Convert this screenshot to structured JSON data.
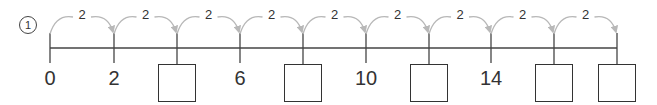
{
  "problem": {
    "number": "1"
  },
  "number_line": {
    "start": 0,
    "step": 2,
    "jump_label": "2",
    "line_color": "#444444",
    "arc_color": "#b8b8b8",
    "ticks": [
      {
        "x": 50,
        "value": "0",
        "blank": false
      },
      {
        "x": 114,
        "value": "2",
        "blank": false
      },
      {
        "x": 177,
        "value": "",
        "blank": true,
        "answer": "4"
      },
      {
        "x": 240,
        "value": "6",
        "blank": false
      },
      {
        "x": 303,
        "value": "",
        "blank": true,
        "answer": "8"
      },
      {
        "x": 366,
        "value": "10",
        "blank": false
      },
      {
        "x": 429,
        "value": "",
        "blank": true,
        "answer": "12"
      },
      {
        "x": 491,
        "value": "14",
        "blank": false
      },
      {
        "x": 554,
        "value": "",
        "blank": true,
        "answer": "16"
      },
      {
        "x": 617,
        "value": "",
        "blank": true,
        "answer": "18"
      }
    ],
    "jumps": [
      "2",
      "2",
      "2",
      "2",
      "2",
      "2",
      "2",
      "2",
      "2"
    ]
  }
}
